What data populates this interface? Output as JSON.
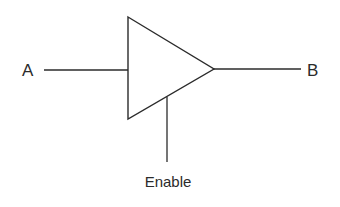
{
  "diagram": {
    "type": "tri-state buffer",
    "labels": {
      "input": "A",
      "output": "B",
      "control": "Enable"
    },
    "colors": {
      "stroke": "#2b2b2b",
      "background": "#ffffff"
    }
  }
}
